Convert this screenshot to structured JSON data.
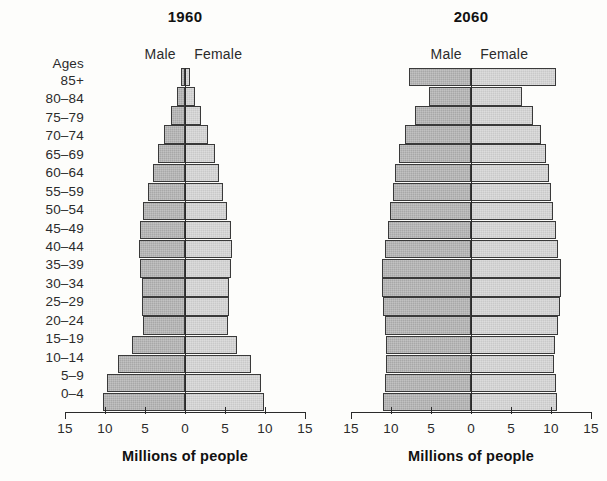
{
  "ages": {
    "header": "Ages",
    "groups": [
      "85+",
      "80–84",
      "75–79",
      "70–74",
      "65–69",
      "60–64",
      "55–59",
      "50–54",
      "45–49",
      "40–44",
      "35–39",
      "30–34",
      "25–29",
      "20–24",
      "15–19",
      "10–14",
      "5–9",
      "0–4"
    ]
  },
  "legend": {
    "male": "Male",
    "female": "Female"
  },
  "axis": {
    "title": "Millions of people",
    "ticks": [
      "15",
      "10",
      "5",
      "0",
      "5",
      "10",
      "15"
    ],
    "tick_values": [
      -15,
      -10,
      -5,
      0,
      5,
      10,
      15
    ],
    "limit": 15
  },
  "colors": {
    "male_fill": "#a8a8a8",
    "female_fill": "#c9c9c9",
    "outline": "#3a3a3a",
    "axis": "#2a2a2a",
    "text": "#2b2b2b",
    "background": "#fdfdfb"
  },
  "panels": [
    {
      "id": "panel-1960",
      "title": "1960"
    },
    {
      "id": "panel-2060",
      "title": "2060"
    }
  ],
  "chart_data": {
    "type": "bar",
    "subtype": "population-pyramid",
    "title": "",
    "xlabel": "Millions of people",
    "ylabel": "Ages",
    "xlim": [
      -15,
      15
    ],
    "xticks": [
      15,
      10,
      5,
      0,
      5,
      10,
      15
    ],
    "grid": false,
    "legend": [
      "Male",
      "Female"
    ],
    "legend_position": "above-axis-center",
    "categories": [
      "85+",
      "80–84",
      "75–79",
      "70–74",
      "65–69",
      "60–64",
      "55–59",
      "50–54",
      "45–49",
      "40–44",
      "35–39",
      "30–34",
      "25–29",
      "20–24",
      "15–19",
      "10–14",
      "5–9",
      "0–4"
    ],
    "panels": [
      {
        "title": "1960",
        "series": [
          {
            "name": "Male",
            "values": [
              0.5,
              1.0,
              1.8,
              2.6,
              3.4,
              4.0,
              4.6,
              5.2,
              5.6,
              5.8,
              5.6,
              5.4,
              5.4,
              5.3,
              6.6,
              8.4,
              9.8,
              10.2
            ]
          },
          {
            "name": "Female",
            "values": [
              0.6,
              1.2,
              2.0,
              2.9,
              3.7,
              4.3,
              4.8,
              5.3,
              5.7,
              5.9,
              5.7,
              5.5,
              5.5,
              5.4,
              6.5,
              8.2,
              9.5,
              9.9
            ]
          }
        ]
      },
      {
        "title": "2060",
        "series": [
          {
            "name": "Male",
            "values": [
              7.8,
              5.3,
              7.0,
              8.2,
              9.0,
              9.5,
              9.8,
              10.1,
              10.4,
              10.8,
              11.1,
              11.1,
              11.0,
              10.8,
              10.6,
              10.6,
              10.8,
              11.0
            ]
          },
          {
            "name": "Female",
            "values": [
              10.6,
              6.4,
              7.8,
              8.8,
              9.4,
              9.8,
              10.0,
              10.3,
              10.6,
              10.9,
              11.2,
              11.2,
              11.1,
              10.9,
              10.5,
              10.4,
              10.6,
              10.8
            ]
          }
        ]
      }
    ]
  }
}
